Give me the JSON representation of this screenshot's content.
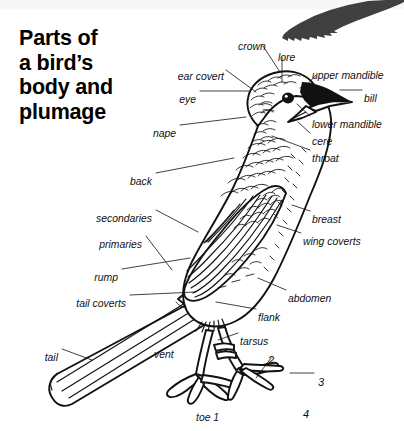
{
  "title": {
    "line1": "Parts of",
    "line2": "a bird’s",
    "line3": "body and",
    "line4": "plumage"
  },
  "colors": {
    "ink": "#111111",
    "background": "#ffffff",
    "silhouette": "#404040",
    "top_band": "#f7f7f7"
  },
  "labels": [
    {
      "key": "crown",
      "text": "crown",
      "x": 238,
      "y": 41,
      "align": "left"
    },
    {
      "key": "lore",
      "text": "lore",
      "x": 278,
      "y": 52,
      "align": "left"
    },
    {
      "key": "ear_covert",
      "text": "ear covert",
      "x": 224,
      "y": 71,
      "align": "right"
    },
    {
      "key": "upper_mandible",
      "text": "upper mandible",
      "x": 312,
      "y": 70,
      "align": "left"
    },
    {
      "key": "eye",
      "text": "eye",
      "x": 196,
      "y": 94,
      "align": "right"
    },
    {
      "key": "bill",
      "text": "bill",
      "x": 364,
      "y": 93,
      "align": "left"
    },
    {
      "key": "lower_mandible",
      "text": "lower mandible",
      "x": 312,
      "y": 119,
      "align": "left"
    },
    {
      "key": "nape",
      "text": "nape",
      "x": 176,
      "y": 128,
      "align": "right"
    },
    {
      "key": "cere",
      "text": "cere",
      "x": 312,
      "y": 136,
      "align": "left"
    },
    {
      "key": "throat",
      "text": "throat",
      "x": 312,
      "y": 153,
      "align": "left"
    },
    {
      "key": "back",
      "text": "back",
      "x": 152,
      "y": 176,
      "align": "right"
    },
    {
      "key": "secondaries",
      "text": "secondaries",
      "x": 152,
      "y": 213,
      "align": "right"
    },
    {
      "key": "breast",
      "text": "breast",
      "x": 312,
      "y": 214,
      "align": "left"
    },
    {
      "key": "primaries",
      "text": "primaries",
      "x": 142,
      "y": 239,
      "align": "right"
    },
    {
      "key": "wing_coverts",
      "text": "wing coverts",
      "x": 303,
      "y": 236,
      "align": "left"
    },
    {
      "key": "rump",
      "text": "rump",
      "x": 118,
      "y": 272,
      "align": "right"
    },
    {
      "key": "tail_coverts",
      "text": "tail coverts",
      "x": 126,
      "y": 298,
      "align": "right"
    },
    {
      "key": "abdomen",
      "text": "abdomen",
      "x": 288,
      "y": 293,
      "align": "left"
    },
    {
      "key": "flank",
      "text": "flank",
      "x": 258,
      "y": 312,
      "align": "left"
    },
    {
      "key": "tarsus",
      "text": "tarsus",
      "x": 240,
      "y": 336,
      "align": "left"
    },
    {
      "key": "tail",
      "text": "tail",
      "x": 58,
      "y": 352,
      "align": "right"
    },
    {
      "key": "vent",
      "text": "vent",
      "x": 154,
      "y": 349,
      "align": "left"
    },
    {
      "key": "toe_1",
      "text": "toe 1",
      "x": 196,
      "y": 412,
      "align": "left"
    }
  ],
  "toe_numbers": [
    {
      "key": "toe_2",
      "text": "2",
      "x": 268,
      "y": 354
    },
    {
      "key": "toe_3",
      "text": "3",
      "x": 318,
      "y": 376
    },
    {
      "key": "toe_4",
      "text": "4",
      "x": 303,
      "y": 408
    }
  ],
  "figure": {
    "silhouette_icon": "bird-wing-silhouette"
  }
}
